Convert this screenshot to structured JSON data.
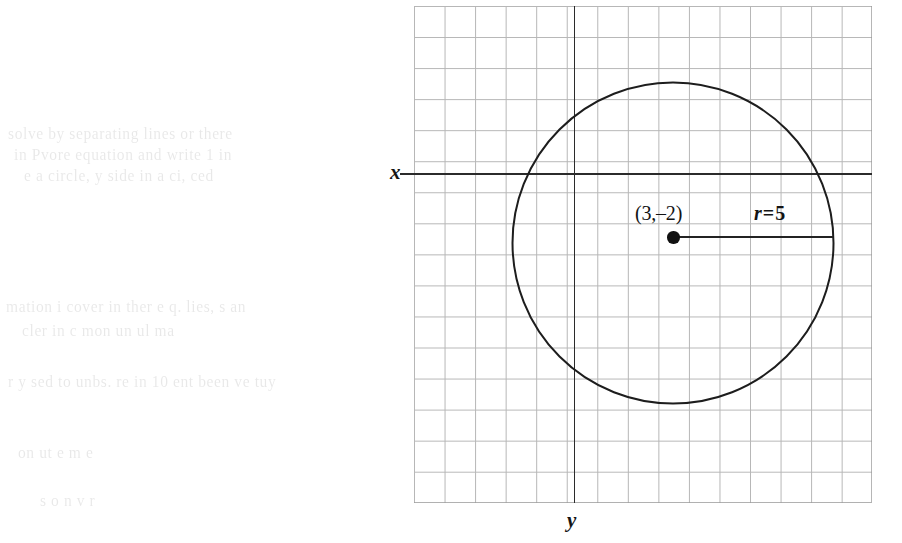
{
  "figure": {
    "kind": "coordinate-grid-circle-diagram",
    "background_color": "#ffffff",
    "ink_color": "#1d1d1d",
    "grid_color": "#9a9a9a"
  },
  "axes": {
    "x_label": "x",
    "y_label": "y",
    "x_axis_name": "horizontal-axis",
    "y_axis_name": "vertical-axis"
  },
  "annotations": {
    "center_label": "(3,–2)",
    "radius_var": "r",
    "radius_equals": "=",
    "radius_value": "5"
  },
  "chart_data": {
    "type": "scatter",
    "title": "",
    "xlabel": "x",
    "ylabel": "y",
    "grid": true,
    "legend": false,
    "grid_columns": 15,
    "grid_rows": 16,
    "unit_cell_px": 30.6,
    "shapes": [
      {
        "shape": "circle",
        "center": [
          3,
          -2
        ],
        "center_text": "(3,–2)",
        "radius": 5,
        "radius_text": "r = 5",
        "stroke": "#1d1d1d"
      },
      {
        "shape": "point",
        "at": [
          3,
          -2
        ],
        "marker": "filled-dot",
        "color": "#111111"
      },
      {
        "shape": "segment",
        "from": [
          3,
          -2
        ],
        "to": [
          8,
          -2
        ],
        "meaning": "radius"
      }
    ]
  },
  "ghost_text": {
    "note": "faint bleed-through from the reverse side of the scanned page",
    "opacity": 0.085,
    "lines": [
      {
        "text": "solve by separating lines or there",
        "x": 8,
        "y": 125
      },
      {
        "text": "in Pvore equation and write 1 in",
        "x": 14,
        "y": 146
      },
      {
        "text": "e a circle, y side in a ci, ced",
        "x": 24,
        "y": 167
      },
      {
        "text": "mation i cover in ther e q. lies, s an",
        "x": 6,
        "y": 298
      },
      {
        "text": "cler in  c  mon  un  ul ma",
        "x": 22,
        "y": 322
      },
      {
        "text": "r y sed to unbs. re in 10 ent been ve  tuy",
        "x": 8,
        "y": 373
      },
      {
        "text": "on  ut   e m   e",
        "x": 18,
        "y": 444
      },
      {
        "text": "s       o   n   v     r",
        "x": 40,
        "y": 492
      }
    ]
  }
}
